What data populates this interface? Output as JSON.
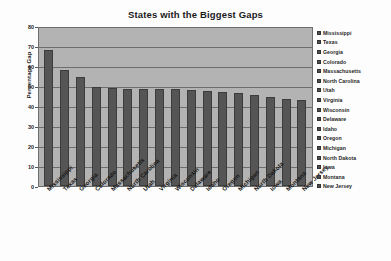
{
  "chart_data": {
    "type": "bar",
    "title": "States with the Biggest Gaps",
    "xlabel": "",
    "ylabel": "Percentage Gap",
    "ylim": [
      0,
      80
    ],
    "yticks": [
      0,
      10,
      20,
      30,
      40,
      50,
      60,
      70,
      80
    ],
    "grid": true,
    "legend_position": "right",
    "categories": [
      "Mississippi",
      "Texas",
      "Georgia",
      "Colorado",
      "Massachusetts",
      "North Carolina",
      "Utah",
      "Virginia",
      "Wisconsin",
      "Delaware",
      "Idaho",
      "Oregon",
      "Michigan",
      "North Dakota",
      "Iowa",
      "Montana",
      "New Jersey"
    ],
    "values": [
      68,
      58,
      54.5,
      49.5,
      49,
      48.5,
      48.5,
      48.5,
      48.5,
      48,
      47.5,
      47,
      46.5,
      45.5,
      44.5,
      43.5,
      43
    ],
    "bar_color": "#555555",
    "plot_background": "#b3b3b3"
  },
  "legend": {
    "items": [
      "Mississippi",
      "Texas",
      "Georgia",
      "Colorado",
      "Massachusetts",
      "North Carolina",
      "Utah",
      "Virginia",
      "Wisconsin",
      "Delaware",
      "Idaho",
      "Oregon",
      "Michigan",
      "North Dakota",
      "Iowa",
      "Montana",
      "New Jersey"
    ]
  }
}
